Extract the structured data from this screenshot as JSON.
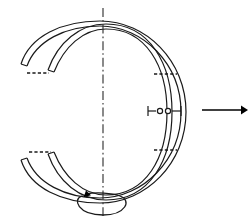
{
  "figure": {
    "background_color": "#ffffff",
    "line_color": "#1a1a1a",
    "width": 252,
    "height": 222
  },
  "axis": {
    "name": "vertical-rotation-axis",
    "style": "dash-dot centerline",
    "x": 103,
    "y_top": 8,
    "y_bottom": 216
  },
  "rings": {
    "count": 2,
    "description": "Two concentric split C-shaped bands drawn in perspective, crossing near the top and bottom poles",
    "outer": {
      "name": "outer-split-band",
      "center_x": 100,
      "center_y": 112,
      "radius_x": 92,
      "radius_y": 86,
      "gap_side": "left",
      "gap_upper_end_deg": 160,
      "gap_lower_end_deg": 200
    },
    "inner": {
      "name": "inner-split-band",
      "center_x": 108,
      "center_y": 112,
      "radius_x": 78,
      "radius_y": 86,
      "gap_side": "left",
      "gap_upper_end_deg": 155,
      "gap_lower_end_deg": 205
    },
    "band_thickness": 4
  },
  "callouts": {
    "dashed_ticks": [
      {
        "name": "tick-upper-left",
        "x1": 27,
        "y1": 73,
        "x2": 48,
        "y2": 73
      },
      {
        "name": "tick-lower-left",
        "x1": 29,
        "y1": 152,
        "x2": 50,
        "y2": 152
      },
      {
        "name": "tick-upper-right",
        "x1": 154,
        "y1": 74,
        "x2": 176,
        "y2": 74
      },
      {
        "name": "tick-lower-right",
        "x1": 154,
        "y1": 150,
        "x2": 176,
        "y2": 150
      }
    ],
    "dots": {
      "name": "gap-dimension-dots",
      "count": 2,
      "y": 111,
      "positions_x": [
        160,
        168
      ],
      "radius": 2.6,
      "stub_left": {
        "x1": 148,
        "x2": 156
      },
      "stub_right": {
        "x1": 172,
        "x2": 180
      }
    }
  },
  "motion": {
    "translation_arrow": {
      "name": "translation-arrow-right",
      "direction": "right",
      "x_start": 202,
      "x_end": 247,
      "y": 110
    },
    "rotation_indicator": {
      "name": "rotation-direction-ellipse",
      "center_x": 103,
      "center_y": 203,
      "radius_x": 25,
      "radius_y": 12,
      "direction": "counter-clockwise",
      "arrow_at": "upper-left"
    }
  }
}
